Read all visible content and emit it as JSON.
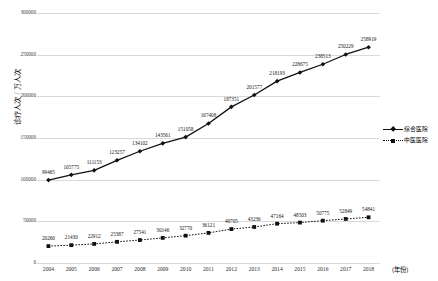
{
  "chart_data": {
    "type": "line",
    "title": "",
    "xlabel": "（年份）",
    "ylabel": "诊疗人次 / 万人次",
    "categories": [
      "2004",
      "2005",
      "2006",
      "2007",
      "2008",
      "2009",
      "2010",
      "2011",
      "2012",
      "2013",
      "2014",
      "2015",
      "2016",
      "2017",
      "2018"
    ],
    "ylim": [
      0,
      300000
    ],
    "yticks": [
      300000,
      250000,
      200000,
      150000,
      100000,
      50000,
      0
    ],
    "ytick_labels": [
      "300000",
      "250000",
      "200000",
      "150000",
      "100000",
      "50000",
      "0"
    ],
    "grid": true,
    "legend_position": "right-middle",
    "series": [
      {
        "name": "综合医院",
        "style": "solid",
        "marker": "diamond",
        "values": [
          99465,
          105775,
          111153,
          123257,
          134102,
          143561,
          151058,
          167408,
          187351,
          201577,
          218193,
          228675,
          238513,
          250229,
          258919
        ]
      },
      {
        "name": "中医医院",
        "style": "dotted",
        "marker": "square",
        "values": [
          20260,
          21430,
          22912,
          25387,
          27541,
          30146,
          32770,
          36121,
          40705,
          43236,
          47164,
          48503,
          50775,
          52849,
          54841
        ]
      }
    ]
  },
  "colors": {
    "line": "#111111",
    "grid": "#d9d9d9",
    "text": "#1a1a1a"
  }
}
